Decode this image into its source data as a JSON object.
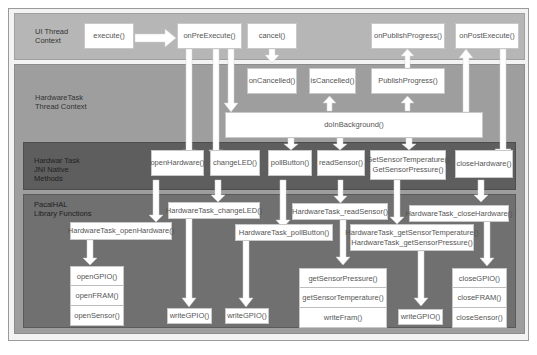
{
  "diagram": {
    "regions": {
      "ui_thread": "UI Thread\nContext",
      "hardware_task_thread": "HardwareTask\nThread Context",
      "jni_methods": "Hardwar Task\nJNI Native\nMethods",
      "pacalhal_library": "PacalHAL\nLibrary Functions"
    },
    "ui": {
      "execute": "execute()",
      "onPreExecute": "onPreExecute()",
      "cancel": "cancel()",
      "onPublishProgress": "onPublishProgress()",
      "onPostExecute": "onPostExecute()"
    },
    "thread": {
      "onCancelled": "onCancelled()",
      "isCancelled": "isCancelled()",
      "publishProgress": "PublishProgress()",
      "doInBackground": "doInBackground()"
    },
    "jni": {
      "openHardware": "openHardware()",
      "changeLED": "changeLED()",
      "pollButton": "pollButton()",
      "readSensor": "readSensor()",
      "getSensor": "GetSensorTemperature()\nGetSensorPressure()",
      "closeHardware": "closeHardware()"
    },
    "lib": {
      "openHardware": "HardwareTask_openHardware()",
      "changeLED": "HardwareTask_changeLED()",
      "pollButton": "HardwareTask_pollButton()",
      "readSensor": "HardwareTask_readSensor()",
      "getSensor": "HardwareTask_getSensorTemperature()\nHardwareTask_getSensorPressure()",
      "closeHardware": "HardwareTask_closeHardware()"
    },
    "low": {
      "open_stack": [
        "openGPIO()",
        "openFRAM()",
        "openSensor()"
      ],
      "writeGPIO_1": "writeGPIO()",
      "writeGPIO_2": "writeGPIO()",
      "read_stack": [
        "getSensorPressure()",
        "getSensorTemperature()",
        "writeFram()"
      ],
      "writeGPIO_3": "writeGPIO()",
      "close_stack": [
        "closeGPIO()",
        "closeFRAM()",
        "closeSensor()"
      ]
    },
    "colors": {
      "ui_region": "#b6b6b6",
      "thread_region": "#9e9e9e",
      "jni_region": "#5e5e5e",
      "lib_region": "#707070",
      "box": "#ffffff",
      "arrow": "#ffffff"
    }
  }
}
